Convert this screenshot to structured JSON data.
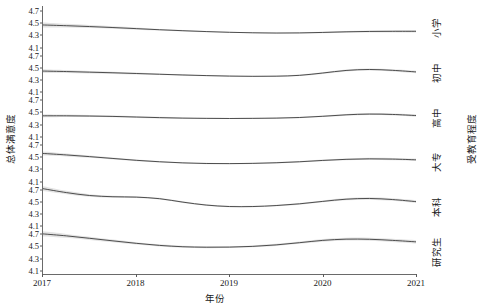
{
  "chart_data": {
    "type": "line",
    "title": "",
    "xlabel": "年份",
    "ylabel": "总体满意度",
    "facet_label": "受教育程度",
    "grid": false,
    "legend": "none",
    "xlim": [
      2017,
      2021
    ],
    "ylim": [
      4.05,
      4.78
    ],
    "x_ticks": [
      2017,
      2018,
      2019,
      2020,
      2021
    ],
    "x_tick_labels": [
      "2017",
      "2018",
      "2019",
      "2020",
      "2021"
    ],
    "y_ticks": [
      4.1,
      4.3,
      4.5,
      4.7
    ],
    "y_tick_labels": [
      "4.1",
      "4.3",
      "4.5",
      "4.7"
    ],
    "line_color": "#3c3c3c",
    "ribbon_color": "#b8b8b8",
    "axis_color": "#6a6a6a",
    "background": "#ffffff",
    "x": [
      2017.0,
      2017.25,
      2017.5,
      2017.75,
      2018.0,
      2018.25,
      2018.5,
      2018.75,
      2019.0,
      2019.25,
      2019.5,
      2019.75,
      2020.0,
      2020.25,
      2020.5,
      2020.75,
      2021.0
    ],
    "series": [
      {
        "name": "小学",
        "panel": 1,
        "values": [
          4.47,
          4.458,
          4.444,
          4.428,
          4.41,
          4.392,
          4.376,
          4.362,
          4.35,
          4.342,
          4.338,
          4.34,
          4.348,
          4.358,
          4.364,
          4.366,
          4.366
        ],
        "ci_upper": [
          4.51,
          4.488,
          4.468,
          4.448,
          4.428,
          4.406,
          4.388,
          4.372,
          4.359,
          4.35,
          4.346,
          4.35,
          4.36,
          4.372,
          4.38,
          4.384,
          4.386
        ],
        "ci_lower": [
          4.43,
          4.428,
          4.42,
          4.408,
          4.392,
          4.378,
          4.364,
          4.352,
          4.341,
          4.334,
          4.33,
          4.33,
          4.336,
          4.344,
          4.348,
          4.348,
          4.346
        ]
      },
      {
        "name": "初中",
        "panel": 2,
        "values": [
          4.452,
          4.444,
          4.434,
          4.424,
          4.412,
          4.4,
          4.388,
          4.378,
          4.37,
          4.366,
          4.368,
          4.382,
          4.42,
          4.462,
          4.478,
          4.464,
          4.438
        ],
        "ci_upper": [
          4.482,
          4.468,
          4.454,
          4.442,
          4.428,
          4.414,
          4.4,
          4.388,
          4.379,
          4.375,
          4.378,
          4.394,
          4.434,
          4.478,
          4.495,
          4.482,
          4.458
        ],
        "ci_lower": [
          4.422,
          4.42,
          4.414,
          4.406,
          4.396,
          4.386,
          4.376,
          4.368,
          4.361,
          4.357,
          4.358,
          4.37,
          4.406,
          4.446,
          4.461,
          4.446,
          4.418
        ]
      },
      {
        "name": "高中",
        "panel": 3,
        "values": [
          4.44,
          4.44,
          4.436,
          4.43,
          4.42,
          4.41,
          4.402,
          4.398,
          4.396,
          4.398,
          4.402,
          4.412,
          4.432,
          4.456,
          4.468,
          4.462,
          4.444
        ],
        "ci_upper": [
          4.466,
          4.46,
          4.452,
          4.444,
          4.434,
          4.423,
          4.414,
          4.408,
          4.405,
          4.407,
          4.412,
          4.423,
          4.445,
          4.47,
          4.484,
          4.479,
          4.464
        ],
        "ci_lower": [
          4.414,
          4.42,
          4.42,
          4.416,
          4.406,
          4.397,
          4.39,
          4.388,
          4.387,
          4.389,
          4.392,
          4.401,
          4.419,
          4.442,
          4.452,
          4.445,
          4.424
        ]
      },
      {
        "name": "大专",
        "panel": 4,
        "values": [
          4.56,
          4.536,
          4.508,
          4.478,
          4.448,
          4.424,
          4.406,
          4.396,
          4.394,
          4.398,
          4.408,
          4.424,
          4.446,
          4.464,
          4.472,
          4.468,
          4.456
        ],
        "ci_upper": [
          4.592,
          4.56,
          4.528,
          4.494,
          4.462,
          4.437,
          4.418,
          4.407,
          4.404,
          4.408,
          4.419,
          4.436,
          4.46,
          4.479,
          4.489,
          4.486,
          4.476
        ],
        "ci_lower": [
          4.528,
          4.512,
          4.488,
          4.462,
          4.434,
          4.411,
          4.394,
          4.385,
          4.384,
          4.388,
          4.397,
          4.412,
          4.432,
          4.449,
          4.455,
          4.45,
          4.436
        ]
      },
      {
        "name": "本科",
        "panel": 5,
        "values": [
          4.72,
          4.656,
          4.608,
          4.588,
          4.582,
          4.556,
          4.5,
          4.452,
          4.428,
          4.428,
          4.444,
          4.472,
          4.512,
          4.548,
          4.56,
          4.542,
          4.508
        ],
        "ci_upper": [
          4.76,
          4.684,
          4.63,
          4.606,
          4.598,
          4.571,
          4.514,
          4.464,
          4.439,
          4.439,
          4.456,
          4.486,
          4.528,
          4.566,
          4.58,
          4.563,
          4.532
        ],
        "ci_lower": [
          4.68,
          4.628,
          4.586,
          4.57,
          4.566,
          4.541,
          4.486,
          4.44,
          4.417,
          4.417,
          4.432,
          4.458,
          4.496,
          4.53,
          4.54,
          4.521,
          4.484
        ]
      },
      {
        "name": "研究生",
        "panel": 6,
        "values": [
          4.7,
          4.668,
          4.628,
          4.586,
          4.546,
          4.512,
          4.49,
          4.482,
          4.484,
          4.496,
          4.52,
          4.556,
          4.594,
          4.614,
          4.612,
          4.594,
          4.57
        ],
        "ci_upper": [
          4.742,
          4.7,
          4.654,
          4.608,
          4.565,
          4.529,
          4.506,
          4.497,
          4.499,
          4.512,
          4.537,
          4.575,
          4.615,
          4.637,
          4.637,
          4.62,
          4.598
        ],
        "ci_lower": [
          4.658,
          4.636,
          4.602,
          4.564,
          4.527,
          4.495,
          4.474,
          4.467,
          4.469,
          4.48,
          4.503,
          4.537,
          4.573,
          4.591,
          4.587,
          4.568,
          4.542
        ]
      }
    ]
  },
  "axis": {
    "y_title": "总体满意度",
    "x_title": "年份",
    "facet_title": "受教育程度"
  }
}
